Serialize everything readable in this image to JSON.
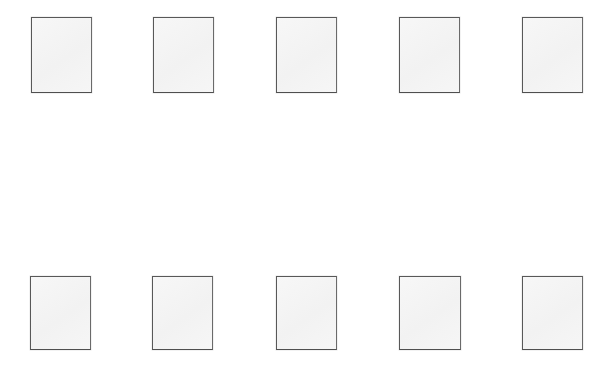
{
  "canvas": {
    "width": 612,
    "height": 373,
    "background_color": "#ffffff",
    "title": "Blank placeholder grid"
  },
  "style": {
    "panel_fill_color": "#f4f4f4",
    "panel_border_color": "#585858",
    "panel_border_width": 1
  },
  "grid": {
    "rows": 2,
    "columns": 5,
    "total_panels": 10,
    "row_tops": [
      17,
      276
    ],
    "panel_width": 61,
    "panel_height": 76
  },
  "panels": [
    {
      "id": "panel-r1c1",
      "row": 1,
      "column": 1,
      "x": 31,
      "y": 17,
      "width": 61,
      "height": 76,
      "label": ""
    },
    {
      "id": "panel-r1c2",
      "row": 1,
      "column": 2,
      "x": 153,
      "y": 17,
      "width": 61,
      "height": 76,
      "label": ""
    },
    {
      "id": "panel-r1c3",
      "row": 1,
      "column": 3,
      "x": 276,
      "y": 17,
      "width": 61,
      "height": 76,
      "label": ""
    },
    {
      "id": "panel-r1c4",
      "row": 1,
      "column": 4,
      "x": 399,
      "y": 17,
      "width": 61,
      "height": 76,
      "label": ""
    },
    {
      "id": "panel-r1c5",
      "row": 1,
      "column": 5,
      "x": 522,
      "y": 17,
      "width": 61,
      "height": 76,
      "label": ""
    },
    {
      "id": "panel-r2c1",
      "row": 2,
      "column": 1,
      "x": 30,
      "y": 276,
      "width": 61,
      "height": 74,
      "label": ""
    },
    {
      "id": "panel-r2c2",
      "row": 2,
      "column": 2,
      "x": 152,
      "y": 276,
      "width": 61,
      "height": 74,
      "label": ""
    },
    {
      "id": "panel-r2c3",
      "row": 2,
      "column": 3,
      "x": 276,
      "y": 276,
      "width": 61,
      "height": 74,
      "label": ""
    },
    {
      "id": "panel-r2c4",
      "row": 2,
      "column": 4,
      "x": 399,
      "y": 276,
      "width": 62,
      "height": 74,
      "label": ""
    },
    {
      "id": "panel-r2c5",
      "row": 2,
      "column": 5,
      "x": 522,
      "y": 276,
      "width": 61,
      "height": 74,
      "label": ""
    }
  ]
}
